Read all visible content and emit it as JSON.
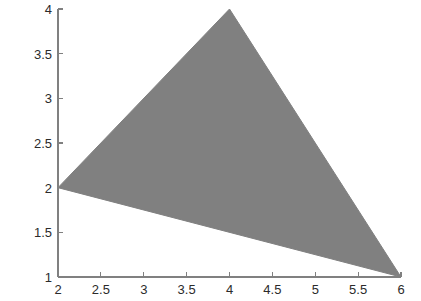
{
  "chart_data": {
    "type": "area",
    "title": "",
    "xlabel": "",
    "ylabel": "",
    "xlim": [
      2,
      6
    ],
    "ylim": [
      1,
      4
    ],
    "grid": false,
    "legend": null,
    "background_color": "#ffffff",
    "axis_color": "#808080",
    "tick_label_color": "#2b2b2b",
    "xticks": [
      2,
      2.5,
      3,
      3.5,
      4,
      4.5,
      5,
      5.5,
      6
    ],
    "xtick_labels": [
      "2",
      "2.5",
      "3",
      "3.5",
      "4",
      "4.5",
      "5",
      "5.5",
      "6"
    ],
    "yticks": [
      1,
      1.5,
      2,
      2.5,
      3,
      3.5,
      4
    ],
    "ytick_labels": [
      "1",
      "1.5",
      "2",
      "2.5",
      "3",
      "3.5",
      "4"
    ],
    "tick_direction": "in",
    "series": [
      {
        "name": "triangle",
        "type": "polygon",
        "fill_color": "#808080",
        "edge_color": "#808080",
        "points": [
          {
            "x": 2,
            "y": 2
          },
          {
            "x": 4,
            "y": 4
          },
          {
            "x": 6,
            "y": 1
          }
        ]
      }
    ]
  },
  "plot_geometry": {
    "left_px": 58,
    "right_px": 401,
    "top_px": 9,
    "bottom_px": 277
  }
}
